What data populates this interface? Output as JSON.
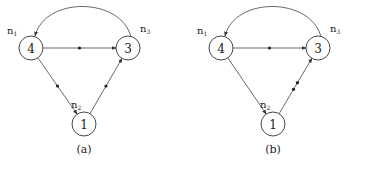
{
  "diagrams": [
    {
      "caption": "(a)",
      "nodes": [
        {
          "id": "n1",
          "label": "4",
          "name": "n",
          "sub": "1"
        },
        {
          "id": "n3",
          "label": "3",
          "name": "n",
          "sub": "3"
        },
        {
          "id": "n2",
          "label": "1",
          "name": "n",
          "sub": "2"
        }
      ],
      "edges": [
        {
          "from": "n1",
          "to": "n3",
          "tokens": 1
        },
        {
          "from": "n1",
          "to": "n2",
          "tokens": 1
        },
        {
          "from": "n2",
          "to": "n3",
          "tokens": 1
        },
        {
          "from": "n3",
          "to": "n1",
          "tokens": 0,
          "curved": true
        }
      ]
    },
    {
      "caption": "(b)",
      "nodes": [
        {
          "id": "n1",
          "label": "4",
          "name": "n",
          "sub": "1"
        },
        {
          "id": "n3",
          "label": "3",
          "name": "n",
          "sub": "3"
        },
        {
          "id": "n2",
          "label": "1",
          "name": "n",
          "sub": "2"
        }
      ],
      "edges": [
        {
          "from": "n1",
          "to": "n3",
          "tokens": 1
        },
        {
          "from": "n1",
          "to": "n2",
          "tokens": 0
        },
        {
          "from": "n2",
          "to": "n3",
          "tokens": 2
        },
        {
          "from": "n3",
          "to": "n1",
          "tokens": 0,
          "curved": true
        }
      ]
    }
  ],
  "colors": {
    "stroke": "#444444",
    "text": "#222222"
  }
}
